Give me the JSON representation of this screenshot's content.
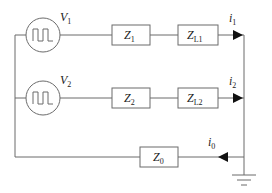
{
  "diagram": {
    "type": "circuit",
    "colors": {
      "wire": "#6b6b6b",
      "arrow": "#111111",
      "text": "#222222",
      "background": "#ffffff"
    },
    "sources": [
      {
        "id": "V1",
        "symbol": "V",
        "sub": "1",
        "waveform": "square-pulse"
      },
      {
        "id": "V2",
        "symbol": "V",
        "sub": "2",
        "waveform": "square-pulse"
      }
    ],
    "impedances": [
      {
        "id": "Z1",
        "symbol": "Z",
        "sub": "1"
      },
      {
        "id": "ZL1",
        "symbol": "Z",
        "sub": "L1"
      },
      {
        "id": "Z2",
        "symbol": "Z",
        "sub": "2"
      },
      {
        "id": "ZL2",
        "symbol": "Z",
        "sub": "L2"
      },
      {
        "id": "Z0",
        "symbol": "Z",
        "sub": "0"
      }
    ],
    "currents": [
      {
        "id": "i1",
        "symbol": "i",
        "sub": "1",
        "direction": "right"
      },
      {
        "id": "i2",
        "symbol": "i",
        "sub": "2",
        "direction": "right"
      },
      {
        "id": "i0",
        "symbol": "i",
        "sub": "0",
        "direction": "left"
      }
    ],
    "ground": {
      "label": "ground"
    }
  }
}
